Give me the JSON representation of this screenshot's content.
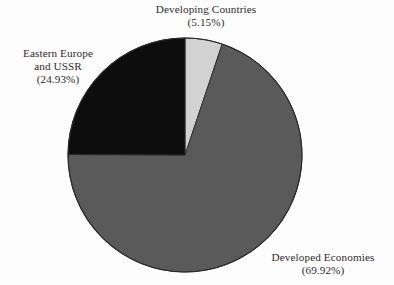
{
  "figure": {
    "background_color": "#fdfdfd",
    "text_color": "#2e2c2d",
    "pie": {
      "center_x": 185,
      "center_y": 155,
      "radius": 117,
      "start_angle_deg": 0,
      "direction": "clockwise",
      "outline_color": "#2a2a2a"
    }
  },
  "chart_data": {
    "type": "pie",
    "title": "",
    "subtitle": "",
    "xlabel": "",
    "ylabel": "",
    "grid": false,
    "legend_position": "none",
    "labels_position": "outside-callout",
    "units": "percent",
    "total": 100.0,
    "categories": [
      "Developing Countries",
      "Developed Economies",
      "Eastern Europe and USSR"
    ],
    "values": [
      5.15,
      69.92,
      24.93
    ],
    "slices": [
      {
        "name": "Developing Countries",
        "value": 5.15,
        "value_label": "(5.15%)",
        "color": "#d2d2d2",
        "start_angle_deg": 0.0,
        "end_angle_deg": 18.54
      },
      {
        "name": "Developed Economies",
        "value": 69.92,
        "value_label": "(69.92%)",
        "color": "#5a5a5a",
        "start_angle_deg": 18.54,
        "end_angle_deg": 270.25
      },
      {
        "name": "Eastern Europe and USSR",
        "value": 24.93,
        "value_label": "(24.93%)",
        "color": "#0d0d0d",
        "start_angle_deg": 270.25,
        "end_angle_deg": 360.0
      }
    ]
  },
  "labels": {
    "developing": {
      "name": "Developing Countries",
      "percent": "(5.15%)"
    },
    "eastern": {
      "line1": "Eastern Europe",
      "line2": "and USSR",
      "percent": "(24.93%)"
    },
    "developed": {
      "name": "Developed Economies",
      "percent": "(69.92%)"
    }
  }
}
